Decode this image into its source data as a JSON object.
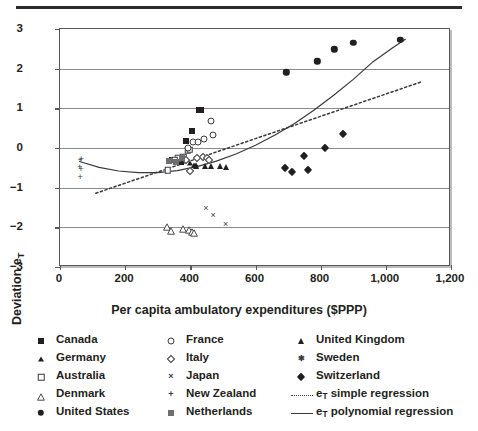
{
  "figure": {
    "rule": "top-divider",
    "xlabel": "Per capita ambulatory expenditures ($PPP)",
    "ylabel_main": "Deviation e",
    "ylabel_sub": "T"
  },
  "chart_data": {
    "type": "scatter",
    "title": "",
    "xlabel": "Per capita ambulatory expenditures ($PPP)",
    "ylabel": "Deviation e_T",
    "xlim": [
      0,
      1200
    ],
    "ylim": [
      -3,
      3
    ],
    "xticks": [
      0,
      200,
      400,
      600,
      800,
      1000,
      1200
    ],
    "xticklabels": [
      "0",
      "200",
      "400",
      "600",
      "800",
      "1,000",
      "1,200"
    ],
    "yticks": [
      -3,
      -2,
      -1,
      0,
      1,
      2,
      3
    ],
    "yticklabels": [
      "−3",
      "−2",
      "−1",
      "0",
      "1",
      "2",
      "3"
    ],
    "grid": "horizontal",
    "legend_position": "below",
    "series": [
      {
        "name": "Canada",
        "marker": "filled-square",
        "points": [
          [
            388,
            0.17
          ],
          [
            404,
            0.43
          ],
          [
            428,
            0.95
          ],
          [
            432,
            0.97
          ],
          [
            345,
            -0.31
          ],
          [
            370,
            -0.36
          ]
        ]
      },
      {
        "name": "Germany",
        "marker": "filled-triangle-small",
        "points": [
          [
            398,
            -0.38
          ],
          [
            412,
            -0.42
          ],
          [
            418,
            -0.44
          ]
        ]
      },
      {
        "name": "Australia",
        "marker": "open-square",
        "points": [
          [
            362,
            -0.26
          ],
          [
            378,
            -0.22
          ],
          [
            392,
            -0.06
          ],
          [
            398,
            -0.04
          ],
          [
            330,
            -0.56
          ],
          [
            352,
            -0.3
          ]
        ]
      },
      {
        "name": "Denmark",
        "marker": "open-triangle",
        "points": [
          [
            328,
            -1.85
          ],
          [
            340,
            -1.94
          ],
          [
            378,
            -1.88
          ],
          [
            396,
            -1.92
          ],
          [
            404,
            -1.97
          ],
          [
            412,
            -1.99
          ]
        ]
      },
      {
        "name": "United States",
        "marker": "filled-circle",
        "points": [
          [
            695,
            1.91
          ],
          [
            790,
            2.19
          ],
          [
            842,
            2.49
          ],
          [
            900,
            2.65
          ],
          [
            1045,
            2.72
          ]
        ]
      },
      {
        "name": "France",
        "marker": "open-circle",
        "points": [
          [
            408,
            0.14
          ],
          [
            424,
            0.16
          ],
          [
            442,
            0.22
          ],
          [
            462,
            0.67
          ],
          [
            470,
            0.32
          ],
          [
            392,
            0.01
          ]
        ]
      },
      {
        "name": "Italy",
        "marker": "open-diamond",
        "points": [
          [
            398,
            -0.57
          ],
          [
            420,
            -0.24
          ],
          [
            438,
            -0.23
          ],
          [
            452,
            -0.25
          ],
          [
            456,
            -0.3
          ],
          [
            386,
            -0.3
          ]
        ]
      },
      {
        "name": "Japan",
        "marker": "x-cross",
        "points": [
          [
            448,
            -1.54
          ],
          [
            470,
            -1.72
          ],
          [
            508,
            -1.93
          ]
        ]
      },
      {
        "name": "New Zealand",
        "marker": "plus",
        "points": [
          [
            62,
            -0.33
          ],
          [
            66,
            -0.3
          ],
          [
            60,
            -0.5
          ],
          [
            64,
            -0.56
          ],
          [
            62,
            -0.76
          ]
        ]
      },
      {
        "name": "Netherlands",
        "marker": "grey-square",
        "points": [
          [
            336,
            -0.33
          ],
          [
            356,
            -0.36
          ],
          [
            374,
            -0.25
          ]
        ]
      },
      {
        "name": "United Kingdom",
        "marker": "filled-triangle",
        "points": [
          [
            418,
            -0.46
          ],
          [
            446,
            -0.46
          ],
          [
            462,
            -0.46
          ],
          [
            490,
            -0.45
          ],
          [
            508,
            -0.47
          ]
        ]
      },
      {
        "name": "Sweden",
        "marker": "asterisk",
        "points": []
      },
      {
        "name": "Switzerland",
        "marker": "filled-diamond",
        "points": [
          [
            690,
            -0.5
          ],
          [
            712,
            -0.6
          ],
          [
            748,
            -0.2
          ],
          [
            812,
            0.0
          ],
          [
            870,
            0.36
          ],
          [
            762,
            -0.56
          ]
        ]
      }
    ],
    "fits": [
      {
        "name": "e_T simple regression",
        "style": "dotted",
        "points": [
          [
            110,
            -1.14
          ],
          [
            1110,
            1.67
          ]
        ]
      },
      {
        "name": "e_T polynomial regression",
        "style": "solid",
        "points": [
          [
            60,
            -0.34
          ],
          [
            120,
            -0.49
          ],
          [
            180,
            -0.58
          ],
          [
            240,
            -0.62
          ],
          [
            300,
            -0.62
          ],
          [
            360,
            -0.57
          ],
          [
            420,
            -0.47
          ],
          [
            480,
            -0.33
          ],
          [
            540,
            -0.15
          ],
          [
            600,
            0.07
          ],
          [
            660,
            0.33
          ],
          [
            720,
            0.62
          ],
          [
            780,
            0.96
          ],
          [
            840,
            1.33
          ],
          [
            900,
            1.73
          ],
          [
            960,
            2.17
          ],
          [
            1020,
            2.52
          ],
          [
            1060,
            2.74
          ]
        ]
      }
    ]
  },
  "legend": {
    "columns": [
      {
        "items": [
          {
            "symbol": "filled-square",
            "label": "Canada"
          },
          {
            "symbol": "filled-triangle-small",
            "label": "Germany"
          },
          {
            "symbol": "open-square",
            "label": "Australia"
          },
          {
            "symbol": "open-triangle",
            "label": "Denmark"
          },
          {
            "symbol": "filled-circle",
            "label": "United States"
          }
        ]
      },
      {
        "items": [
          {
            "symbol": "open-circle",
            "label": "France"
          },
          {
            "symbol": "open-diamond",
            "label": "Italy"
          },
          {
            "symbol": "x-cross",
            "label": "Japan"
          },
          {
            "symbol": "plus",
            "label": "New Zealand"
          },
          {
            "symbol": "grey-square",
            "label": "Netherlands"
          }
        ]
      },
      {
        "items": [
          {
            "symbol": "filled-triangle",
            "label": "United Kingdom"
          },
          {
            "symbol": "asterisk",
            "label": "Sweden"
          },
          {
            "symbol": "filled-diamond",
            "label": "Switzerland"
          },
          {
            "symbol": "dotted-line",
            "label_main": "e",
            "label_sub": "T",
            "label_rest": " simple regression"
          },
          {
            "symbol": "solid-line",
            "label_main": "e",
            "label_sub": "T",
            "label_rest": " polynomial regression"
          }
        ]
      }
    ]
  }
}
